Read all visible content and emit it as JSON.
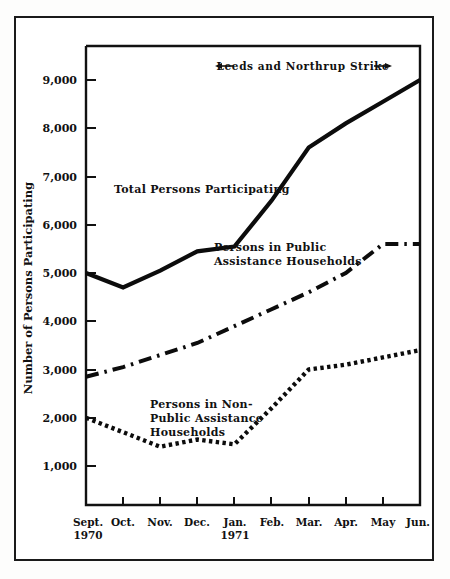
{
  "chart_data": {
    "type": "line",
    "title": "",
    "xlabel": "",
    "ylabel": "Number of Persons Participating",
    "categories": [
      "Sept.",
      "Oct.",
      "Nov.",
      "Dec.",
      "Jan.",
      "Feb.",
      "Mar.",
      "Apr.",
      "May",
      "Jun."
    ],
    "category_sublabels": [
      "1970",
      "",
      "",
      "",
      "1971",
      "",
      "",
      "",
      "",
      ""
    ],
    "yticks": [
      1000,
      2000,
      3000,
      4000,
      5000,
      6000,
      7000,
      8000,
      9000
    ],
    "ytick_labels": [
      "1,000",
      "2,000",
      "3,000",
      "4,000",
      "5,000",
      "6,000",
      "7,000",
      "8,000",
      "9,000"
    ],
    "ylim": [
      0,
      9800
    ],
    "grid": false,
    "legend_position": "inline-annotations",
    "series": [
      {
        "name": "Total Persons Participating",
        "style": "solid",
        "values": [
          5000,
          4700,
          5050,
          5450,
          5550,
          6500,
          7600,
          8100,
          8550,
          9000
        ]
      },
      {
        "name": "Persons in Public Assistance Households",
        "style": "dash-dot",
        "values": [
          2850,
          3050,
          3300,
          3550,
          3900,
          4250,
          4600,
          5000,
          5600,
          5600
        ]
      },
      {
        "name": "Persons in Non-Public Assistance Households",
        "style": "dotted",
        "values": [
          2000,
          1700,
          1400,
          1550,
          1450,
          2200,
          3000,
          3100,
          3250,
          3400
        ]
      }
    ],
    "annotations": [
      {
        "id": "total-label",
        "text": "Total Persons Participating"
      },
      {
        "id": "pa-label-line1",
        "text": "Persons in Public"
      },
      {
        "id": "pa-label-line2",
        "text": "Assistance Households"
      },
      {
        "id": "npa-label-line1",
        "text": "Persons in Non-"
      },
      {
        "id": "npa-label-line2",
        "text": "Public Assistance"
      },
      {
        "id": "npa-label-line3",
        "text": "Households"
      },
      {
        "id": "strike-span",
        "text": "Leeds and Northrup Strike"
      }
    ],
    "colors": {
      "ink": "#0c0c0c",
      "background": "#ffffff",
      "frame": "#1a1a1a"
    }
  }
}
